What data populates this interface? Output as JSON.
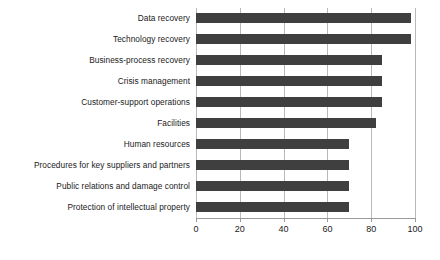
{
  "chart_data": {
    "type": "bar",
    "orientation": "horizontal",
    "title": "",
    "xlabel": "",
    "ylabel": "",
    "xlim": [
      0,
      100
    ],
    "grid": true,
    "legend": "none",
    "bar_color": "#3f3f3f",
    "gridline_color": "#b9b9b9",
    "axis_color": "#9a9a9a",
    "xticks": [
      0,
      20,
      40,
      60,
      80,
      100
    ],
    "xtick_labels": [
      "0",
      "20",
      "40",
      "60",
      "80",
      "100"
    ],
    "categories": [
      "Data recovery",
      "Technology recovery",
      "Business-process recovery",
      "Crisis management",
      "Customer-support operations",
      "Facilities",
      "Human resources",
      "Procedures for key suppliers and partners",
      "Public relations and damage control",
      "Protection of intellectual property"
    ],
    "values": [
      98,
      98,
      85,
      85,
      85,
      82,
      70,
      70,
      70,
      70
    ]
  }
}
